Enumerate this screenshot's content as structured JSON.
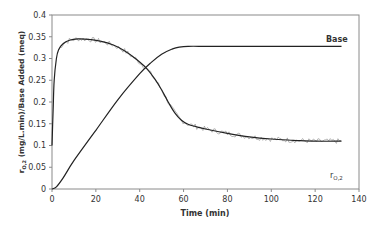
{
  "chart_data": {
    "type": "line",
    "title": "",
    "xlabel": "Time (min)",
    "ylabel": "r0,2 (mg/L.min)/Base Added (meq)",
    "ylabel_main": "r",
    "ylabel_sub": "O,2",
    "ylabel_rest": " (mg/L.min)/Base Added (meq)",
    "xlim": [
      0,
      140
    ],
    "ylim": [
      0,
      0.4
    ],
    "xticks": [
      0,
      20,
      40,
      60,
      80,
      100,
      120,
      140
    ],
    "yticks": [
      0,
      0.05,
      0.1,
      0.15,
      0.2,
      0.25,
      0.3,
      0.35,
      0.4
    ],
    "ytick_labels": [
      "0",
      "0.05",
      "0.1",
      "0.15",
      "0.2",
      "0.25",
      "0.3",
      "0.35",
      "0.4"
    ],
    "grid": false,
    "legend": "inline labels",
    "series": [
      {
        "name": "Base",
        "label": "Base",
        "x": [
          0,
          2,
          5,
          10,
          20,
          30,
          40,
          45,
          50,
          55,
          58,
          62,
          70,
          80,
          100,
          120,
          132
        ],
        "values": [
          0,
          0.005,
          0.025,
          0.065,
          0.135,
          0.205,
          0.265,
          0.29,
          0.31,
          0.322,
          0.326,
          0.328,
          0.328,
          0.328,
          0.328,
          0.328,
          0.328
        ]
      },
      {
        "name": "r0,2",
        "label_main": "r",
        "label_sub": "O,2",
        "x": [
          0,
          0.5,
          1,
          2,
          3,
          5,
          8,
          12,
          17,
          22,
          28,
          33,
          38,
          43,
          47,
          50,
          53,
          56,
          59,
          62,
          66,
          70,
          80,
          90,
          100,
          110,
          120,
          132
        ],
        "values": [
          0.1,
          0.18,
          0.25,
          0.3,
          0.32,
          0.334,
          0.342,
          0.345,
          0.344,
          0.34,
          0.331,
          0.318,
          0.3,
          0.278,
          0.252,
          0.228,
          0.2,
          0.175,
          0.158,
          0.149,
          0.143,
          0.138,
          0.128,
          0.12,
          0.115,
          0.112,
          0.11,
          0.11
        ]
      }
    ]
  }
}
